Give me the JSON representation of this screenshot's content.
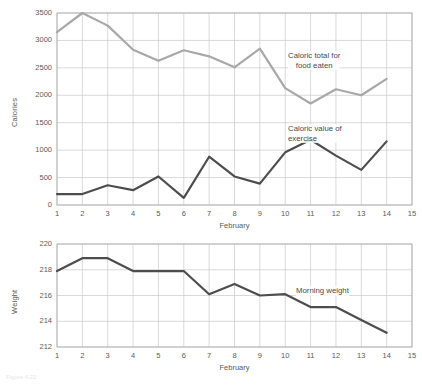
{
  "figure": {
    "caption": "Figure 4.22"
  },
  "chart_data": [
    {
      "id": "calories",
      "type": "line",
      "title": "",
      "xlabel": "February",
      "ylabel": "Calories",
      "xlim": [
        1,
        15
      ],
      "ylim": [
        0,
        3500
      ],
      "ytick_values": [
        0,
        500,
        1000,
        1500,
        2000,
        2500,
        3000,
        3500
      ],
      "ytick_labels": [
        "0",
        "500",
        "1000",
        "1500",
        "2000",
        "2500",
        "3000",
        "3500"
      ],
      "xtick_values": [
        1,
        2,
        3,
        4,
        5,
        6,
        7,
        8,
        9,
        10,
        11,
        12,
        13,
        14,
        15
      ],
      "xtick_labels": [
        "1",
        "2",
        "3",
        "4",
        "5",
        "6",
        "7",
        "8",
        "9",
        "10",
        "11",
        "12",
        "13",
        "14",
        "15"
      ],
      "grid": true,
      "legend_position": "inline-annotation",
      "x": [
        1,
        2,
        3,
        4,
        5,
        6,
        7,
        8,
        9,
        10,
        11,
        12,
        13,
        14
      ],
      "series": [
        {
          "name": "Caloric total for food eaten",
          "color": "#a8a8a8",
          "annotation": "Caloric total for\nfood eaten",
          "annotation_line1": "Caloric total for",
          "annotation_line2": "food eaten",
          "values": [
            3150,
            3500,
            3270,
            2830,
            2630,
            2820,
            2710,
            2510,
            2850,
            2130,
            1850,
            2110,
            2000,
            2300
          ]
        },
        {
          "name": "Caloric value of exercise",
          "color": "#4d4d4d",
          "annotation": "Caloric value of\nexercise",
          "annotation_line1": "Caloric value of",
          "annotation_line2": "exercise",
          "values": [
            200,
            200,
            360,
            270,
            520,
            130,
            880,
            520,
            390,
            960,
            1190,
            900,
            640,
            1160
          ]
        }
      ]
    },
    {
      "id": "weight",
      "type": "line",
      "title": "",
      "xlabel": "February",
      "ylabel": "Weight",
      "xlim": [
        1,
        15
      ],
      "ylim": [
        212,
        220
      ],
      "ytick_values": [
        212,
        214,
        216,
        218,
        220
      ],
      "ytick_labels": [
        "212",
        "214",
        "216",
        "218",
        "220"
      ],
      "xtick_values": [
        1,
        2,
        3,
        4,
        5,
        6,
        7,
        8,
        9,
        10,
        11,
        12,
        13,
        14,
        15
      ],
      "xtick_labels": [
        "1",
        "2",
        "3",
        "4",
        "5",
        "6",
        "7",
        "8",
        "9",
        "10",
        "11",
        "12",
        "13",
        "14",
        "15"
      ],
      "grid": true,
      "legend_position": "inline-annotation",
      "x": [
        1,
        2,
        3,
        4,
        5,
        6,
        7,
        8,
        9,
        10,
        11,
        12,
        13,
        14
      ],
      "series": [
        {
          "name": "Morning weight",
          "color": "#4d4d4d",
          "annotation": "Morning weight",
          "annotation_line1": "Morning weight",
          "annotation_line2": "",
          "values": [
            217.9,
            218.9,
            218.9,
            217.9,
            217.9,
            217.9,
            216.1,
            216.9,
            216.0,
            216.1,
            215.1,
            215.1,
            214.1,
            213.1
          ]
        }
      ]
    }
  ]
}
